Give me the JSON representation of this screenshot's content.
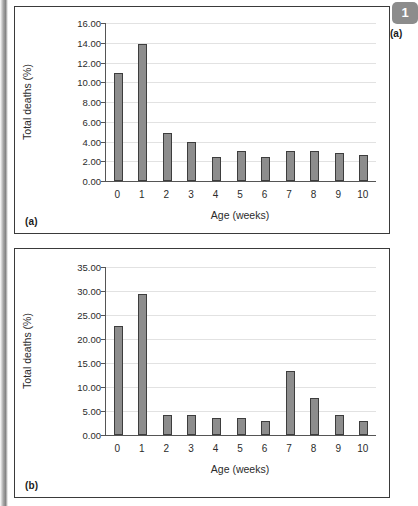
{
  "page": {
    "corner_badge": "1",
    "corner_caption": "(a)"
  },
  "panels": [
    {
      "id": "a",
      "label": "(a)"
    },
    {
      "id": "b",
      "label": "(b)"
    }
  ],
  "chart_data": [
    {
      "type": "bar",
      "panel": "(a)",
      "title": "",
      "xlabel": "Age (weeks)",
      "ylabel": "Total deaths (%)",
      "categories": [
        "0",
        "1",
        "2",
        "3",
        "4",
        "5",
        "6",
        "7",
        "8",
        "9",
        "10"
      ],
      "values": [
        10.9,
        13.9,
        4.9,
        3.95,
        2.4,
        3.0,
        2.4,
        3.0,
        3.0,
        2.85,
        2.6
      ],
      "ylim": [
        0.0,
        16.0
      ],
      "yticks": [
        "0.00",
        "2.00",
        "4.00",
        "6.00",
        "8.00",
        "10.00",
        "12.00",
        "14.00",
        "16.00"
      ],
      "ytick_values": [
        0,
        2,
        4,
        6,
        8,
        10,
        12,
        14,
        16
      ],
      "grid": true,
      "legend": "none",
      "bar_color": "#8d8d8d",
      "bar_edge_color": "#3d3d3d"
    },
    {
      "type": "bar",
      "panel": "(b)",
      "title": "",
      "xlabel": "Age (weeks)",
      "ylabel": "Total deaths (%)",
      "categories": [
        "0",
        "1",
        "2",
        "3",
        "4",
        "5",
        "6",
        "7",
        "8",
        "9",
        "10"
      ],
      "values": [
        22.7,
        29.3,
        4.2,
        4.2,
        3.6,
        3.6,
        3.0,
        13.4,
        7.8,
        4.1,
        2.9
      ],
      "ylim": [
        0.0,
        35.0
      ],
      "yticks": [
        "0.00",
        "5.00",
        "10.00",
        "15.00",
        "20.00",
        "25.00",
        "30.00",
        "35.00"
      ],
      "ytick_values": [
        0,
        5,
        10,
        15,
        20,
        25,
        30,
        35
      ],
      "grid": true,
      "legend": "none",
      "bar_color": "#8d8d8d",
      "bar_edge_color": "#3d3d3d"
    }
  ]
}
